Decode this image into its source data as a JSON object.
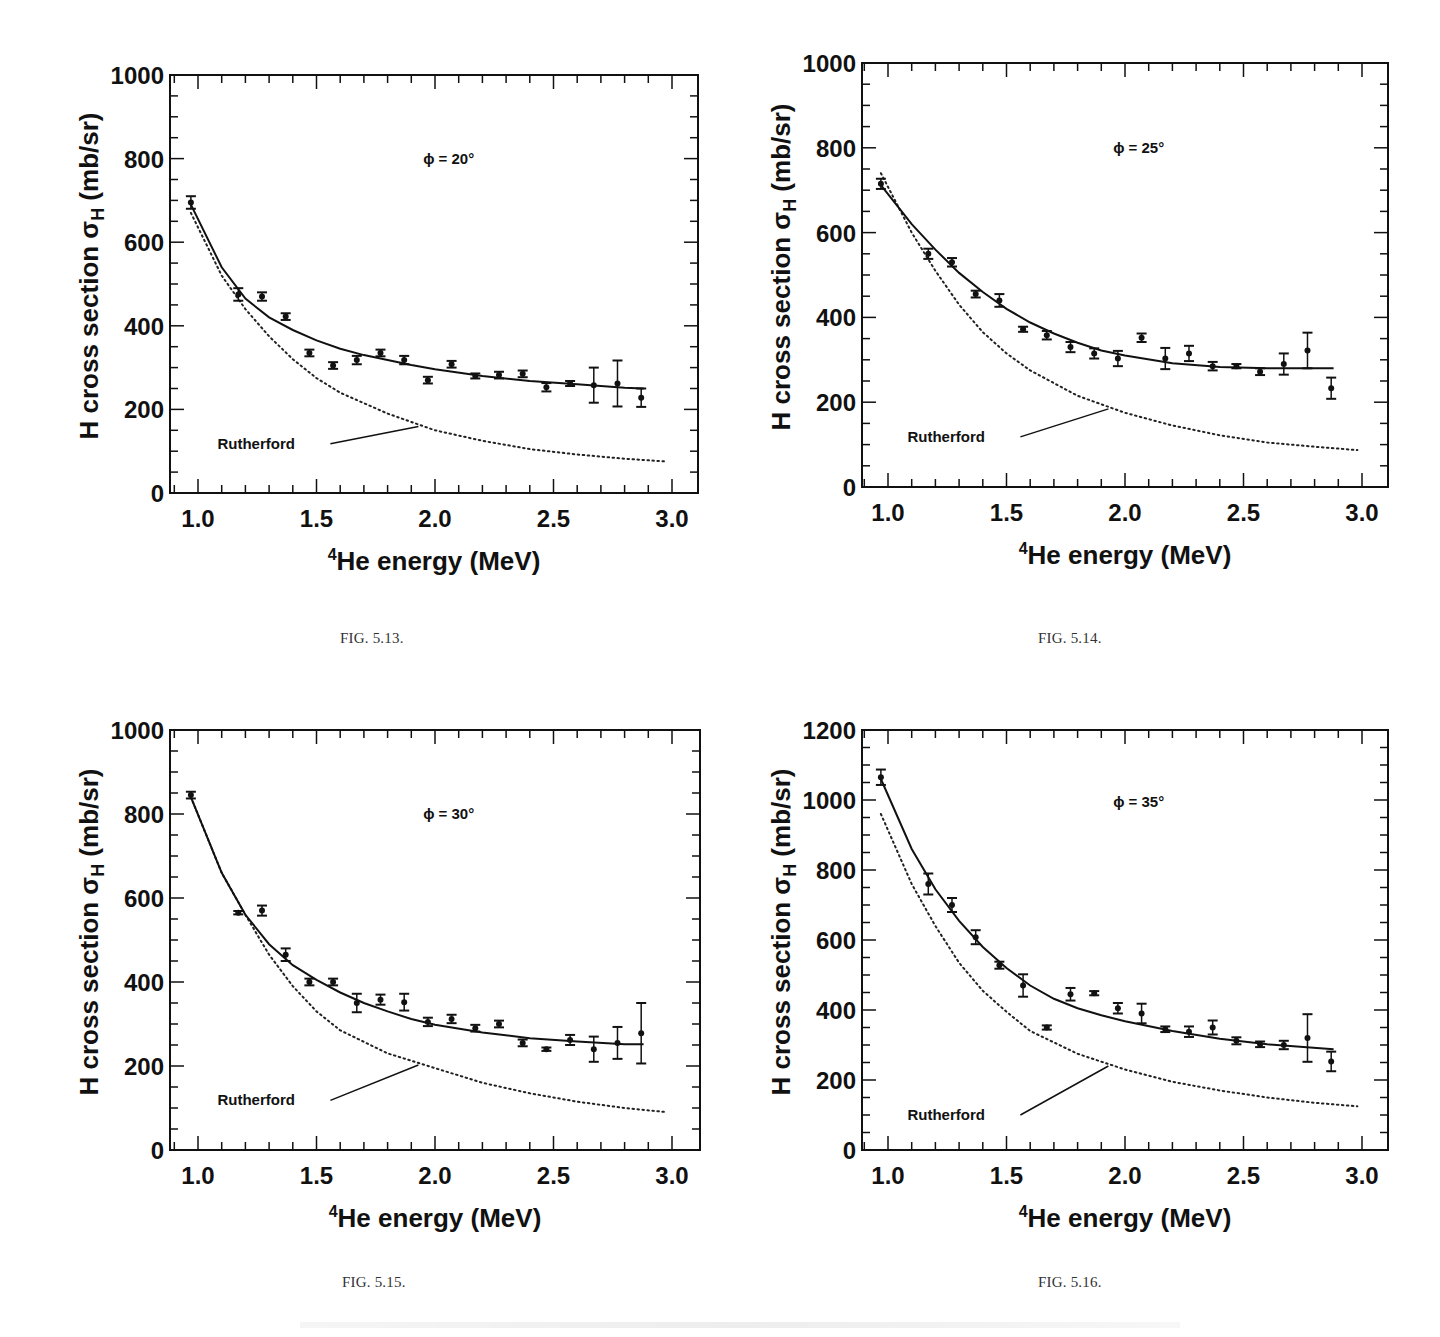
{
  "figures": [
    {
      "caption": "FIG. 5.13.",
      "phi_label": "ϕ = 20°"
    },
    {
      "caption": "FIG. 5.14.",
      "phi_label": "ϕ = 25°"
    },
    {
      "caption": "FIG. 5.15.",
      "phi_label": "ϕ = 30°"
    },
    {
      "caption": "FIG. 5.16.",
      "phi_label": "ϕ = 35°"
    }
  ],
  "axis": {
    "ylabel": "H cross section σH (mb/sr)",
    "xlabel": "4He energy (MeV)",
    "xlabel_sup": "4",
    "xlabel_main": "He energy (MeV)",
    "rutherford_label": "Rutherford"
  },
  "chart_data": [
    {
      "type": "scatter",
      "title": "ϕ = 20°",
      "caption": "FIG. 5.13.",
      "xlabel": "4He energy (MeV)",
      "ylabel": "H cross section σH (mb/sr)",
      "xlim": [
        0.9,
        3.1
      ],
      "ylim": [
        0,
        1000
      ],
      "xticks": [
        1.0,
        1.5,
        2.0,
        2.5,
        3.0
      ],
      "yticks": [
        0,
        200,
        400,
        600,
        800,
        1000
      ],
      "grid": false,
      "series": [
        {
          "name": "data",
          "x": [
            0.97,
            1.17,
            1.27,
            1.37,
            1.47,
            1.57,
            1.67,
            1.77,
            1.87,
            1.97,
            2.07,
            2.17,
            2.27,
            2.37,
            2.47,
            2.57,
            2.67,
            2.77,
            2.87
          ],
          "y": [
            695,
            475,
            470,
            422,
            335,
            305,
            318,
            335,
            318,
            270,
            308,
            280,
            282,
            285,
            253,
            262,
            258,
            262,
            228
          ],
          "err": [
            15,
            15,
            10,
            8,
            8,
            8,
            10,
            8,
            10,
            8,
            8,
            6,
            8,
            8,
            10,
            6,
            42,
            55,
            22
          ]
        },
        {
          "name": "fit (solid)",
          "x": [
            0.97,
            1.1,
            1.2,
            1.3,
            1.4,
            1.5,
            1.6,
            1.7,
            1.8,
            1.9,
            2.0,
            2.2,
            2.4,
            2.6,
            2.8,
            2.88
          ],
          "y": [
            690,
            540,
            465,
            420,
            390,
            365,
            345,
            330,
            318,
            306,
            296,
            280,
            268,
            260,
            252,
            250
          ]
        },
        {
          "name": "Rutherford (dotted)",
          "x": [
            0.97,
            1.1,
            1.2,
            1.3,
            1.4,
            1.5,
            1.6,
            1.8,
            2.0,
            2.2,
            2.4,
            2.6,
            2.8,
            2.98
          ],
          "y": [
            670,
            520,
            440,
            375,
            320,
            275,
            240,
            190,
            150,
            125,
            105,
            92,
            82,
            75
          ]
        }
      ]
    },
    {
      "type": "scatter",
      "title": "ϕ = 25°",
      "caption": "FIG. 5.14.",
      "xlabel": "4He energy (MeV)",
      "ylabel": "H cross section σH (mb/sr)",
      "xlim": [
        0.9,
        3.1
      ],
      "ylim": [
        0,
        1000
      ],
      "xticks": [
        1.0,
        1.5,
        2.0,
        2.5,
        3.0
      ],
      "yticks": [
        0,
        200,
        400,
        600,
        800,
        1000
      ],
      "grid": false,
      "series": [
        {
          "name": "data",
          "x": [
            0.97,
            1.17,
            1.27,
            1.37,
            1.47,
            1.57,
            1.67,
            1.77,
            1.87,
            1.97,
            2.07,
            2.17,
            2.27,
            2.37,
            2.47,
            2.57,
            2.67,
            2.77,
            2.87
          ],
          "y": [
            715,
            550,
            530,
            455,
            440,
            372,
            358,
            330,
            315,
            303,
            352,
            303,
            315,
            285,
            285,
            272,
            290,
            322,
            233
          ],
          "err": [
            12,
            12,
            10,
            8,
            15,
            6,
            10,
            12,
            12,
            18,
            10,
            25,
            18,
            10,
            5,
            8,
            25,
            42,
            25
          ]
        },
        {
          "name": "fit (solid)",
          "x": [
            0.97,
            1.1,
            1.2,
            1.3,
            1.4,
            1.5,
            1.6,
            1.7,
            1.8,
            1.9,
            2.0,
            2.2,
            2.4,
            2.6,
            2.88
          ],
          "y": [
            712,
            620,
            560,
            505,
            460,
            420,
            388,
            362,
            340,
            322,
            310,
            292,
            283,
            280,
            280
          ]
        },
        {
          "name": "Rutherford (dotted)",
          "x": [
            0.97,
            1.1,
            1.2,
            1.3,
            1.4,
            1.5,
            1.6,
            1.8,
            2.0,
            2.2,
            2.4,
            2.6,
            2.8,
            2.98
          ],
          "y": [
            740,
            600,
            510,
            430,
            365,
            315,
            275,
            215,
            175,
            145,
            122,
            105,
            95,
            87
          ]
        }
      ]
    },
    {
      "type": "scatter",
      "title": "ϕ = 30°",
      "caption": "FIG. 5.15.",
      "xlabel": "4He energy (MeV)",
      "ylabel": "H cross section σH (mb/sr)",
      "xlim": [
        0.9,
        3.1
      ],
      "ylim": [
        0,
        1000
      ],
      "xticks": [
        1.0,
        1.5,
        2.0,
        2.5,
        3.0
      ],
      "yticks": [
        0,
        200,
        400,
        600,
        800,
        1000
      ],
      "grid": false,
      "series": [
        {
          "name": "data",
          "x": [
            0.97,
            1.17,
            1.27,
            1.37,
            1.47,
            1.57,
            1.67,
            1.77,
            1.87,
            1.97,
            2.07,
            2.17,
            2.27,
            2.37,
            2.47,
            2.57,
            2.67,
            2.77,
            2.87
          ],
          "y": [
            845,
            565,
            570,
            465,
            400,
            400,
            350,
            358,
            352,
            305,
            312,
            290,
            300,
            255,
            240,
            262,
            240,
            255,
            278
          ],
          "err": [
            8,
            4,
            12,
            15,
            8,
            8,
            22,
            12,
            20,
            10,
            10,
            8,
            8,
            8,
            4,
            12,
            30,
            38,
            72
          ]
        },
        {
          "name": "fit (solid)",
          "x": [
            0.97,
            1.1,
            1.2,
            1.3,
            1.4,
            1.5,
            1.6,
            1.7,
            1.8,
            1.9,
            2.0,
            2.2,
            2.4,
            2.6,
            2.8,
            2.88
          ],
          "y": [
            840,
            660,
            560,
            490,
            440,
            405,
            375,
            350,
            330,
            312,
            298,
            280,
            266,
            258,
            252,
            252
          ]
        },
        {
          "name": "Rutherford (dotted)",
          "x": [
            0.97,
            1.1,
            1.2,
            1.3,
            1.4,
            1.5,
            1.6,
            1.8,
            2.0,
            2.2,
            2.4,
            2.6,
            2.8,
            2.98
          ],
          "y": [
            840,
            660,
            560,
            465,
            390,
            330,
            285,
            230,
            195,
            160,
            135,
            115,
            100,
            90
          ]
        }
      ]
    },
    {
      "type": "scatter",
      "title": "ϕ = 35°",
      "caption": "FIG. 5.16.",
      "xlabel": "4He energy (MeV)",
      "ylabel": "H cross section σH (mb/sr)",
      "xlim": [
        0.9,
        3.1
      ],
      "ylim": [
        0,
        1200
      ],
      "xticks": [
        1.0,
        1.5,
        2.0,
        2.5,
        3.0
      ],
      "yticks": [
        0,
        200,
        400,
        600,
        800,
        1000,
        1200
      ],
      "grid": false,
      "series": [
        {
          "name": "data",
          "x": [
            0.97,
            1.17,
            1.27,
            1.37,
            1.47,
            1.57,
            1.67,
            1.77,
            1.87,
            1.97,
            2.07,
            2.17,
            2.27,
            2.37,
            2.47,
            2.57,
            2.67,
            2.77,
            2.87
          ],
          "y": [
            1065,
            760,
            700,
            608,
            528,
            470,
            350,
            445,
            448,
            405,
            390,
            345,
            338,
            350,
            312,
            302,
            300,
            320,
            253
          ],
          "err": [
            22,
            30,
            20,
            20,
            10,
            32,
            6,
            18,
            6,
            15,
            28,
            8,
            15,
            20,
            10,
            8,
            12,
            68,
            28
          ]
        },
        {
          "name": "fit (solid)",
          "x": [
            0.97,
            1.1,
            1.2,
            1.3,
            1.4,
            1.5,
            1.6,
            1.7,
            1.8,
            1.9,
            2.0,
            2.2,
            2.4,
            2.6,
            2.88
          ],
          "y": [
            1060,
            860,
            745,
            655,
            580,
            520,
            470,
            432,
            405,
            385,
            368,
            340,
            318,
            302,
            288
          ]
        },
        {
          "name": "Rutherford (dotted)",
          "x": [
            0.97,
            1.1,
            1.2,
            1.3,
            1.4,
            1.5,
            1.6,
            1.8,
            2.0,
            2.2,
            2.4,
            2.6,
            2.8,
            2.98
          ],
          "y": [
            960,
            760,
            640,
            535,
            455,
            395,
            340,
            275,
            230,
            195,
            170,
            150,
            135,
            125
          ]
        }
      ]
    }
  ]
}
